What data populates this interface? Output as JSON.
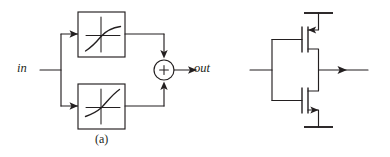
{
  "figure": {
    "type": "circuit-block-diagram",
    "background_color": "#ffffff",
    "ink_color": "#231f20",
    "width": 390,
    "height": 157
  },
  "panel_a": {
    "caption": "(a)",
    "input_label": "in",
    "output_label": "out",
    "summer_symbol": "+",
    "blocks": [
      {
        "id": "upper-block",
        "transfer_shape": "compressive",
        "description": "saturating / compressive nonlinearity"
      },
      {
        "id": "lower-block",
        "transfer_shape": "expansive",
        "description": "expansive / exponential nonlinearity"
      }
    ]
  },
  "panel_b": {
    "caption": "(b)",
    "input_label_base": "V",
    "input_label_sub": "in",
    "output_label_base": "I",
    "output_label_sub": "out",
    "devices": [
      {
        "id": "pmos-top",
        "type": "PMOS",
        "position": "top"
      },
      {
        "id": "nmos-bottom",
        "type": "NMOS",
        "position": "bottom"
      }
    ],
    "rails": [
      {
        "id": "vdd-rail",
        "position": "top"
      },
      {
        "id": "vss-rail",
        "position": "bottom"
      }
    ]
  }
}
